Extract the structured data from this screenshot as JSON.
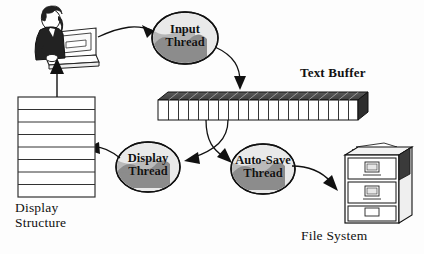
{
  "diagram": {
    "type": "block-flow-diagram",
    "background": "#fdfdfd",
    "colors": {
      "ink": "#111111",
      "ellipse_outer": "#e9e9e9",
      "ellipse_inner": "#8c8c8c",
      "cabinet_fill": "#ffffff",
      "buffer_top": "#4a4a4a",
      "buffer_side": "#2d2d2d",
      "buffer_face": "#ffffff",
      "person_dark": "#222222"
    },
    "nodes": [
      {
        "id": "user-terminal",
        "kind": "actor-icon",
        "icon_name": "person-at-computer-icon",
        "label": "",
        "x": 24,
        "y": 8,
        "w": 72,
        "h": 56
      },
      {
        "id": "input-thread",
        "kind": "thread-ellipse",
        "label_lines": [
          "Input",
          "Thread"
        ],
        "cx": 185,
        "cy": 38,
        "rx": 33,
        "ry": 26
      },
      {
        "id": "text-buffer",
        "kind": "array-3d",
        "label": "Text Buffer",
        "cells": 19,
        "x": 158,
        "y": 92,
        "w": 200,
        "h": 24
      },
      {
        "id": "display-thread",
        "kind": "thread-ellipse",
        "label_lines": [
          "Display",
          "Thread"
        ],
        "cx": 148,
        "cy": 167,
        "rx": 32,
        "ry": 25
      },
      {
        "id": "auto-save-thread",
        "kind": "thread-ellipse",
        "label_lines": [
          "Auto-Save",
          "Thread"
        ],
        "cx": 263,
        "cy": 169,
        "rx": 32,
        "ry": 25
      },
      {
        "id": "display-structure",
        "kind": "row-stack",
        "label_lines": [
          "Display",
          "Structure"
        ],
        "rows": 8,
        "x": 18,
        "y": 97,
        "w": 77,
        "h": 100
      },
      {
        "id": "file-system",
        "kind": "filing-cabinet",
        "label": "File System",
        "drawers": 3,
        "x": 345,
        "y": 145,
        "w": 55,
        "h": 78
      }
    ],
    "edges": [
      {
        "id": "e1",
        "from": "user-terminal",
        "to": "input-thread",
        "style": "curved-arrow"
      },
      {
        "id": "e2",
        "from": "input-thread",
        "to": "text-buffer",
        "style": "curved-arrow"
      },
      {
        "id": "e3",
        "from": "text-buffer",
        "to": "display-thread",
        "style": "curved-arrow"
      },
      {
        "id": "e4",
        "from": "text-buffer",
        "to": "auto-save-thread",
        "style": "curved-arrow"
      },
      {
        "id": "e5",
        "from": "display-thread",
        "to": "display-structure",
        "style": "curved-arrow"
      },
      {
        "id": "e6",
        "from": "display-structure",
        "to": "user-terminal",
        "style": "straight-arrow"
      },
      {
        "id": "e7",
        "from": "auto-save-thread",
        "to": "file-system",
        "style": "curved-arrow"
      }
    ],
    "labels": {
      "text_buffer": "Text Buffer",
      "file_system": "File System",
      "display_structure_line1": "Display",
      "display_structure_line2": "Structure",
      "input_thread_line1": "Input",
      "input_thread_line2": "Thread",
      "display_thread_line1": "Display",
      "display_thread_line2": "Thread",
      "autosave_thread_line1": "Auto-Save",
      "autosave_thread_line2": "Thread"
    }
  }
}
